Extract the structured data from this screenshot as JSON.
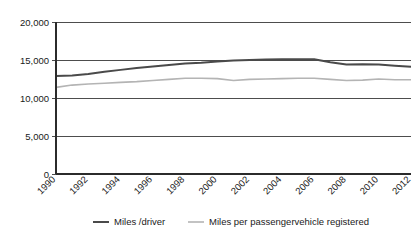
{
  "chart_data": {
    "type": "line",
    "title": "",
    "subtitle": "",
    "xlabel": "",
    "ylabel": "",
    "grid": "horizontal",
    "legend_position": "bottom",
    "xlim": [
      1990,
      2012
    ],
    "ylim": [
      0,
      20000
    ],
    "y_ticks": [
      0,
      5000,
      10000,
      15000,
      20000
    ],
    "y_tick_labels": [
      "0",
      "5,000",
      "10,000",
      "15,000",
      "20,000"
    ],
    "x_ticks": [
      1990,
      1992,
      1994,
      1996,
      1998,
      2000,
      2002,
      2004,
      2006,
      2008,
      2010,
      2012
    ],
    "x_tick_labels": [
      "1990",
      "1992",
      "1994",
      "1996",
      "1998",
      "2000",
      "2002",
      "2004",
      "2006",
      "2008",
      "2010",
      "2012"
    ],
    "x": [
      1990,
      1991,
      1992,
      1993,
      1994,
      1995,
      1996,
      1997,
      1998,
      1999,
      2000,
      2001,
      2002,
      2003,
      2004,
      2005,
      2006,
      2007,
      2008,
      2009,
      2010,
      2011,
      2012
    ],
    "series": [
      {
        "name": "Miles /driver",
        "color": "#4a4a4a",
        "width": 2.0,
        "values": [
          12900,
          12950,
          13150,
          13450,
          13700,
          13950,
          14150,
          14350,
          14550,
          14650,
          14800,
          14950,
          15000,
          15050,
          15100,
          15100,
          15100,
          14700,
          14400,
          14450,
          14400,
          14250,
          14100
        ]
      },
      {
        "name": "Miles per passengervehicle registered",
        "color": "#b4b4b4",
        "width": 1.6,
        "values": [
          11400,
          11700,
          11850,
          11950,
          12050,
          12150,
          12300,
          12450,
          12600,
          12600,
          12550,
          12300,
          12450,
          12500,
          12550,
          12600,
          12600,
          12450,
          12300,
          12350,
          12500,
          12400,
          12400
        ]
      }
    ]
  },
  "legend": {
    "items": [
      {
        "label": "Miles /driver",
        "color": "#4a4a4a"
      },
      {
        "label": "Miles per passengervehicle registered",
        "color": "#b4b4b4"
      }
    ]
  }
}
